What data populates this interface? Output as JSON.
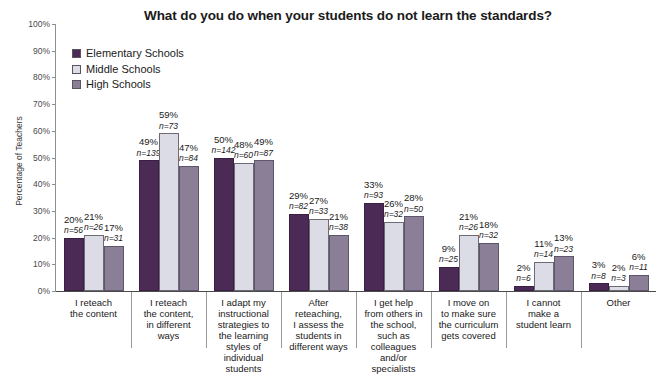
{
  "chart_data": {
    "type": "bar",
    "title": "What do you do when your students do not learn the standards?",
    "xlabel": "",
    "ylabel": "Percentage of Teachers",
    "ylim": [
      0,
      100
    ],
    "grid": false,
    "legend_position": "top-left-inside",
    "y_ticks": [
      "0%",
      "10%",
      "20%",
      "30%",
      "40%",
      "50%",
      "60%",
      "70%",
      "80%",
      "90%",
      "100%"
    ],
    "categories": [
      "I reteach\nthe content",
      "I reteach\nthe content,\nin different\nways",
      "I adapt my\ninstructional\nstrategies to\nthe learning\nstyles of\nindividual\nstudents",
      "After\nreteaching,\nI assess the\nstudents in\ndifferent ways",
      "I get help\nfrom others in\nthe school,\nsuch as\ncolleagues\nand/or\nspecialists",
      "I move on\nto make sure\nthe curriculum\ngets covered",
      "I cannot\nmake a\nstudent learn",
      "Other"
    ],
    "series": [
      {
        "name": "Elementary Schools",
        "color": "#4b2a55",
        "values": [
          20,
          49,
          50,
          29,
          33,
          9,
          2,
          3
        ],
        "labels": [
          "20%",
          "49%",
          "50%",
          "29%",
          "33%",
          "9%",
          "2%",
          "3%"
        ],
        "n": [
          56,
          139,
          142,
          82,
          93,
          25,
          6,
          8
        ],
        "n_labels": [
          "n=56",
          "n=139",
          "n=142",
          "n=82",
          "n=93",
          "n=25",
          "n=6",
          "n=8"
        ]
      },
      {
        "name": "Middle Schools",
        "color": "#dcdce6",
        "values": [
          21,
          59,
          48,
          27,
          26,
          21,
          11,
          2
        ],
        "labels": [
          "21%",
          "59%",
          "48%",
          "27%",
          "26%",
          "21%",
          "11%",
          "2%"
        ],
        "n": [
          26,
          73,
          60,
          33,
          32,
          26,
          14,
          3
        ],
        "n_labels": [
          "n=26",
          "n=73",
          "n=60",
          "n=33",
          "n=32",
          "n=26",
          "n=14",
          "n=3"
        ]
      },
      {
        "name": "High Schools",
        "color": "#8a7f97",
        "values": [
          17,
          47,
          49,
          21,
          28,
          18,
          13,
          6
        ],
        "labels": [
          "17%",
          "47%",
          "49%",
          "21%",
          "28%",
          "18%",
          "13%",
          "6%"
        ],
        "n": [
          31,
          84,
          87,
          38,
          50,
          32,
          23,
          11
        ],
        "n_labels": [
          "n=31",
          "n=84",
          "n=87",
          "n=38",
          "n=50",
          "n=32",
          "n=23",
          "n=11"
        ]
      }
    ]
  },
  "legend": {
    "items": [
      {
        "label": "Elementary Schools",
        "color": "#4b2a55"
      },
      {
        "label": "Middle Schools",
        "color": "#dcdce6"
      },
      {
        "label": "High Schools",
        "color": "#8a7f97"
      }
    ]
  }
}
